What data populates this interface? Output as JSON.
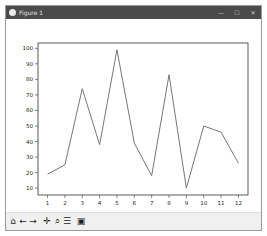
{
  "window": {
    "title": "Figure 1",
    "controls": {
      "minimize": "—",
      "maximize": "☐",
      "close": "✕"
    }
  },
  "toolbar": {
    "buttons": [
      {
        "name": "home",
        "glyph": "⌂"
      },
      {
        "name": "back",
        "glyph": "←"
      },
      {
        "name": "forward",
        "glyph": "→"
      },
      {
        "name": "pan",
        "glyph": "✛"
      },
      {
        "name": "zoom",
        "glyph": "⌕"
      },
      {
        "name": "configure-subplots",
        "glyph": "☰"
      },
      {
        "name": "save",
        "glyph": "▣"
      }
    ]
  },
  "chart_data": {
    "type": "line",
    "title": "",
    "xlabel": "",
    "ylabel": "",
    "x": [
      1,
      2,
      3,
      4,
      5,
      6,
      7,
      8,
      9,
      10,
      11,
      12
    ],
    "series": [
      {
        "name": "series-1",
        "color": "#777777",
        "values": [
          19,
          25,
          74,
          38,
          99,
          39,
          18,
          83,
          10,
          50,
          46,
          26
        ]
      }
    ],
    "xticks": [
      "1",
      "2",
      "3",
      "4",
      "5",
      "6",
      "7",
      "8",
      "9",
      "10",
      "11",
      "12"
    ],
    "yticks": [
      "10",
      "20",
      "30",
      "40",
      "50",
      "60",
      "70",
      "80",
      "90",
      "100"
    ],
    "xlim": [
      0.45,
      12.55
    ],
    "ylim": [
      5.6,
      103.4
    ],
    "grid": false,
    "legend": null
  }
}
